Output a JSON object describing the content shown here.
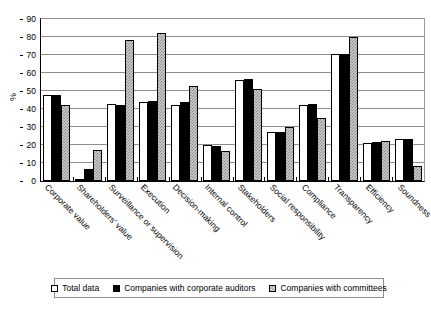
{
  "chart_data": {
    "type": "bar",
    "title": "",
    "xlabel": "",
    "ylabel": "%",
    "ylim": [
      0,
      90
    ],
    "ytick_step": 10,
    "yticks": [
      0,
      10,
      20,
      30,
      40,
      50,
      60,
      70,
      80,
      90
    ],
    "grid": true,
    "legend_position": "bottom",
    "categories": [
      "Corporate value",
      "Shareholders' value",
      "Surveillance or supervision",
      "Execution",
      "Decision-making",
      "Internal control",
      "Stakeholders",
      "Social responsibility",
      "Compliance",
      "Transparency",
      "Efficiency",
      "Soundness"
    ],
    "series": [
      {
        "name": "Total data",
        "swatch": "s0",
        "color": "#ffffff",
        "values": [
          48,
          0.5,
          43,
          44,
          42,
          20,
          56,
          27,
          42,
          70.5,
          21,
          23.5
        ]
      },
      {
        "name": "Companies with corporate auditors",
        "swatch": "s1",
        "color": "#000000",
        "values": [
          48,
          6.5,
          42,
          44.5,
          44,
          19.5,
          56.5,
          27,
          43,
          70.5,
          21.5,
          23.5
        ]
      },
      {
        "name": "Companies with committees",
        "swatch": "s2",
        "color": "#cfcfcf",
        "values": [
          42,
          17.5,
          78.5,
          82,
          53,
          16.5,
          51,
          30,
          35,
          80,
          22.5,
          8.5
        ]
      }
    ]
  },
  "legend": {
    "items": [
      {
        "label": "Total data",
        "swatch": "s0"
      },
      {
        "label": "Companies with corporate auditors",
        "swatch": "s1"
      },
      {
        "label": "Companies with committees",
        "swatch": "s2"
      }
    ]
  },
  "axis": {
    "y_title": "%"
  }
}
